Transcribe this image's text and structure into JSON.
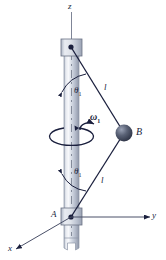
{
  "figure": {
    "name": "rotating-shaft-two-rod-sphere-assembly",
    "axes": {
      "z_label": "z",
      "x_label": "x",
      "y_label": "y"
    },
    "points": {
      "top_pivot_label": "",
      "bottom_collar_label": "A",
      "sphere_label": "B"
    },
    "rods": {
      "upper_length_label": "l",
      "lower_length_label": "l"
    },
    "angles": {
      "upper_symbol": "θ",
      "upper_subscript": "1",
      "lower_symbol": "θ",
      "lower_subscript": "1"
    },
    "angular_velocity": {
      "symbol": "ω",
      "subscript": "1"
    },
    "caption": ""
  },
  "colors": {
    "line": "#1a1f3d",
    "shaft_light": "#f2f4f7",
    "shaft_mid": "#c8ced9",
    "shaft_dark": "#9aa3b4",
    "collar_fill": "#d6dae4",
    "sphere_dark": "#3a4156",
    "sphere_light": "#8e96ab",
    "background": "#ffffff"
  }
}
